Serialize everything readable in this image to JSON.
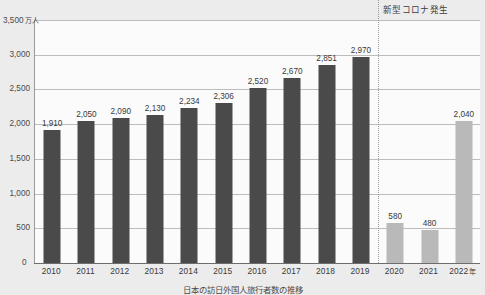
{
  "chart_data": {
    "type": "bar",
    "title": "",
    "xlabel": "年",
    "ylabel": "万人",
    "unit_label": "万人",
    "ylim": [
      0,
      3500
    ],
    "yticks": [
      0,
      500,
      1000,
      1500,
      2000,
      2500,
      3000,
      3500
    ],
    "ytick_labels": [
      "0",
      "500",
      "1,000",
      "1,500",
      "2,000",
      "2,500",
      "3,000",
      "3,500"
    ],
    "grid": true,
    "legend": "none",
    "categories": [
      "2010",
      "2011",
      "2012",
      "2013",
      "2014",
      "2015",
      "2016",
      "2017",
      "2018",
      "2019",
      "2020",
      "2021",
      "2022"
    ],
    "values": [
      1910,
      2050,
      2090,
      2130,
      2234,
      2306,
      2520,
      2670,
      2851,
      2970,
      580,
      480,
      2040
    ],
    "value_labels": [
      "1,910",
      "2,050",
      "2,090",
      "2,130",
      "2,234",
      "2,306",
      "2,520",
      "2,670",
      "2,851",
      "2,970",
      "580",
      "480",
      "2,040"
    ],
    "bar_styles": [
      "dark",
      "dark",
      "dark",
      "dark",
      "dark",
      "dark",
      "dark",
      "dark",
      "dark",
      "dark",
      "light",
      "light",
      "light"
    ],
    "annotations": [
      {
        "text": "新型コロナ発生",
        "after_category": "2019",
        "style": "dotted-vertical-divider"
      }
    ],
    "colors": {
      "bar_dark": "#4a4a4a",
      "bar_light": "#b9b9b9",
      "gridline": "#bdbdbd",
      "axis": "#6d6d6d",
      "background": "#ececed",
      "plot_background": "#fbfbfb",
      "text": "#3a3a3a"
    }
  },
  "axis": {
    "y_top_label_value": "3,500",
    "y_top_label_unit": "万人",
    "x_last_label": "2022",
    "x_last_unit": "年",
    "zero_label": "0"
  },
  "caption": {
    "text": "日本の訪日外国人旅行者数の推移"
  }
}
